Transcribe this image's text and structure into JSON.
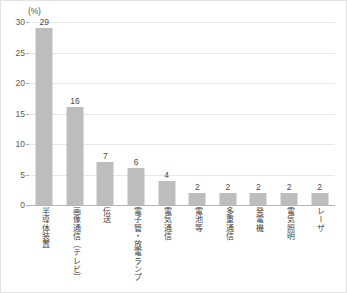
{
  "chart_data": {
    "type": "bar",
    "title": "",
    "subtitle": "",
    "xlabel": "",
    "ylabel": "(%)",
    "ylim": [
      0,
      30
    ],
    "ytick_values": [
      0,
      5,
      10,
      15,
      20,
      25,
      30
    ],
    "ytick_labels": [
      "0",
      "5",
      "10",
      "15",
      "20",
      "25",
      "30"
    ],
    "grid": true,
    "legend": null,
    "bar_color": "#bdbdbd",
    "gridline_color": "#e8e8e8",
    "axis_color": "#b6b6b6",
    "categories": [
      "半導体装置",
      "画像通信（テレビ）",
      "伝送",
      "電子管・放電ランプ",
      "電気通信",
      "電池等",
      "多重通信",
      "発電機",
      "電気照明",
      "レーザ"
    ],
    "values": [
      29,
      16,
      7,
      6,
      4,
      2,
      2,
      2,
      2,
      2
    ],
    "value_labels": [
      "29",
      "16",
      "7",
      "6",
      "4",
      "2",
      "2",
      "2",
      "2",
      "2"
    ]
  }
}
